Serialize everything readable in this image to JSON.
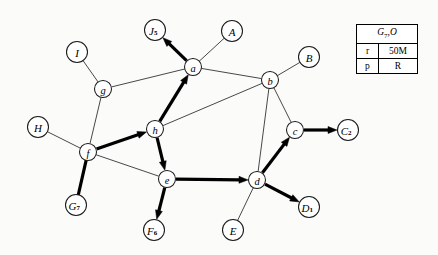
{
  "figure": {
    "name": "directed-graph-diagram",
    "width": 438,
    "height": 255,
    "background_color": "#fbfbfa"
  },
  "info_table": {
    "name": "graph-info-table",
    "header": {
      "base": "G",
      "sub": "7",
      "tail": ",O",
      "full": "G7,O"
    },
    "rows": [
      {
        "key": "r",
        "value": "50M"
      },
      {
        "key": "p",
        "value": "R"
      }
    ]
  },
  "graph": {
    "node_radius_lower": 8.5,
    "node_radius_upper": 10.5,
    "colors": {
      "node_fill": "#ffffff",
      "node_stroke": "#1a1a1a",
      "thin_edge": "#333333",
      "bold_edge": "#000000"
    },
    "nodes": [
      {
        "id": "J5",
        "label": "J",
        "sub": "5",
        "x": 155,
        "y": 30,
        "kind": "upper",
        "r": 10.5
      },
      {
        "id": "A",
        "label": "A",
        "sub": "",
        "x": 232,
        "y": 31,
        "kind": "upper",
        "r": 10.5
      },
      {
        "id": "I",
        "label": "I",
        "sub": "",
        "x": 77,
        "y": 52,
        "kind": "upper",
        "r": 10.5
      },
      {
        "id": "B",
        "label": "B",
        "sub": "",
        "x": 309,
        "y": 57,
        "kind": "upper",
        "r": 10.5
      },
      {
        "id": "a",
        "label": "a",
        "sub": "",
        "x": 193,
        "y": 67,
        "kind": "lower",
        "r": 8.5
      },
      {
        "id": "b",
        "label": "b",
        "sub": "",
        "x": 270,
        "y": 80,
        "kind": "lower",
        "r": 8.5
      },
      {
        "id": "g",
        "label": "g",
        "sub": "",
        "x": 103,
        "y": 89,
        "kind": "lower",
        "r": 8.5
      },
      {
        "id": "H",
        "label": "H",
        "sub": "",
        "x": 38,
        "y": 127,
        "kind": "upper",
        "r": 10.5
      },
      {
        "id": "h",
        "label": "h",
        "sub": "",
        "x": 155,
        "y": 129,
        "kind": "lower",
        "r": 8.5
      },
      {
        "id": "c",
        "label": "c",
        "sub": "",
        "x": 295,
        "y": 130,
        "kind": "lower",
        "r": 8.5
      },
      {
        "id": "C2",
        "label": "C",
        "sub": "2",
        "x": 348,
        "y": 130,
        "kind": "upper",
        "r": 10.5
      },
      {
        "id": "f",
        "label": "f",
        "sub": "",
        "x": 88,
        "y": 152,
        "kind": "lower",
        "r": 8.5
      },
      {
        "id": "e",
        "label": "e",
        "sub": "",
        "x": 167,
        "y": 179,
        "kind": "lower",
        "r": 8.5
      },
      {
        "id": "d",
        "label": "d",
        "sub": "",
        "x": 257,
        "y": 180,
        "kind": "lower",
        "r": 8.5
      },
      {
        "id": "G7",
        "label": "G",
        "sub": "7",
        "x": 76,
        "y": 205,
        "kind": "upper",
        "r": 10.5
      },
      {
        "id": "D1",
        "label": "D",
        "sub": "1",
        "x": 309,
        "y": 207,
        "kind": "upper",
        "r": 10.5
      },
      {
        "id": "E",
        "label": "E",
        "sub": "",
        "x": 233,
        "y": 230,
        "kind": "upper",
        "r": 10.5
      },
      {
        "id": "F6",
        "label": "F",
        "sub": "6",
        "x": 154,
        "y": 230,
        "kind": "upper",
        "r": 10.5
      }
    ],
    "edges": [
      {
        "from": "a",
        "to": "J5",
        "style": "bold",
        "arrow": true
      },
      {
        "from": "A",
        "to": "a",
        "style": "thin",
        "arrow": false
      },
      {
        "from": "I",
        "to": "g",
        "style": "thin",
        "arrow": false
      },
      {
        "from": "g",
        "to": "a",
        "style": "thin",
        "arrow": false
      },
      {
        "from": "a",
        "to": "b",
        "style": "thin",
        "arrow": false
      },
      {
        "from": "B",
        "to": "b",
        "style": "thin",
        "arrow": false
      },
      {
        "from": "g",
        "to": "f",
        "style": "thin",
        "arrow": false
      },
      {
        "from": "H",
        "to": "f",
        "style": "thin",
        "arrow": false
      },
      {
        "from": "h",
        "to": "a",
        "style": "bold",
        "arrow": true
      },
      {
        "from": "h",
        "to": "b",
        "style": "thin",
        "arrow": false
      },
      {
        "from": "b",
        "to": "c",
        "style": "thin",
        "arrow": false
      },
      {
        "from": "b",
        "to": "d",
        "style": "thin",
        "arrow": false
      },
      {
        "from": "f",
        "to": "h",
        "style": "bold",
        "arrow": true
      },
      {
        "from": "f",
        "to": "e",
        "style": "thin",
        "arrow": false
      },
      {
        "from": "G7",
        "to": "f",
        "style": "bold",
        "arrow": false
      },
      {
        "from": "h",
        "to": "e",
        "style": "bold",
        "arrow": true
      },
      {
        "from": "e",
        "to": "d",
        "style": "bold",
        "arrow": true
      },
      {
        "from": "e",
        "to": "F6",
        "style": "bold",
        "arrow": true
      },
      {
        "from": "d",
        "to": "c",
        "style": "bold",
        "arrow": true
      },
      {
        "from": "c",
        "to": "C2",
        "style": "bold",
        "arrow": true
      },
      {
        "from": "d",
        "to": "D1",
        "style": "bold",
        "arrow": true
      },
      {
        "from": "E",
        "to": "d",
        "style": "thin",
        "arrow": false
      }
    ]
  }
}
